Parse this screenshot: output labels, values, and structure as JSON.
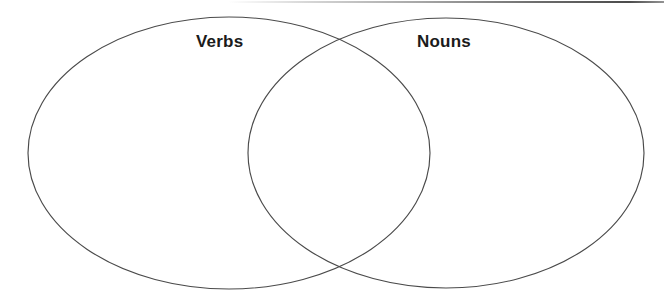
{
  "page": {
    "background_color": "#ffffff",
    "width": 672,
    "height": 302
  },
  "diagram": {
    "type": "venn-two-set",
    "stroke_color": "#4a4a4a",
    "fill_color": "none",
    "sets": [
      {
        "id": "left",
        "label": "Verbs",
        "label_color": "#1b1b1b",
        "center_x": 229,
        "center_y": 153,
        "radius_x": 201,
        "radius_y": 136,
        "label_x": 228,
        "label_y": 42,
        "items": []
      },
      {
        "id": "right",
        "label": "Nouns",
        "label_color": "#1b1b1b",
        "center_x": 446,
        "center_y": 153,
        "radius_x": 198,
        "radius_y": 135,
        "label_x": 449,
        "label_y": 42,
        "items": []
      }
    ],
    "intersection": {
      "id": "overlap",
      "label": "",
      "top_point_x": 336,
      "top_point_y": 44,
      "bottom_point_x": 337,
      "bottom_point_y": 266,
      "items": []
    }
  },
  "artifacts": {
    "top_scan_edge": {
      "name": "scan-edge-line",
      "x": 228,
      "y": 1,
      "width": 436,
      "height": 2,
      "color": "#4a4a4a"
    }
  }
}
